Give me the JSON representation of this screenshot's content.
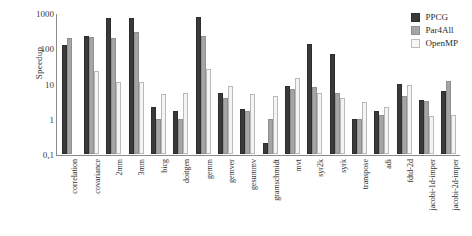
{
  "chart_data": {
    "type": "bar",
    "title": "",
    "xlabel": "",
    "ylabel": "Speedup",
    "yscale": "log",
    "ylim": [
      0.1,
      1000
    ],
    "ytick_labels": [
      "1000",
      "100",
      "10",
      "1",
      "0,1"
    ],
    "ytick_values": [
      1000,
      100,
      10,
      1,
      0.1
    ],
    "grid": false,
    "legend_position": "top-right",
    "categories": [
      "correlation",
      "covariance",
      "2mm",
      "3mm",
      "bicg",
      "doitgen",
      "gemm",
      "gemver",
      "gesummv",
      "gramschmidt",
      "mvt",
      "syr2k",
      "syrk",
      "transpose",
      "adi",
      "fdtd-2d",
      "jacobi-1d-imper",
      "jacobi-2d-imper"
    ],
    "series": [
      {
        "name": "PPCG",
        "color": "#3a3a3a",
        "values": [
          120,
          230,
          700,
          700,
          2.1,
          1.7,
          750,
          5.5,
          1.9,
          0.2,
          8.5,
          130,
          70,
          1.0,
          1.7,
          9.5,
          3.5,
          6.0
        ]
      },
      {
        "name": "Par4All",
        "color": "#a5a5a5",
        "values": [
          200,
          210,
          190,
          290,
          1.0,
          1.0,
          220,
          4.0,
          1.7,
          1.0,
          7.0,
          8.0,
          5.5,
          1.0,
          1.3,
          4.5,
          3.2,
          12.0
        ]
      },
      {
        "name": "OpenMP",
        "color": "#f4f4f4",
        "values": [
          null,
          23,
          11,
          11,
          5.0,
          5.5,
          26,
          8.5,
          5.0,
          4.5,
          14.0,
          5.5,
          4.0,
          3.0,
          2.2,
          9.0,
          1.2,
          1.3
        ]
      }
    ]
  },
  "legend": {
    "items": [
      {
        "label": "PPCG"
      },
      {
        "label": "Par4All"
      },
      {
        "label": "OpenMP"
      }
    ]
  }
}
